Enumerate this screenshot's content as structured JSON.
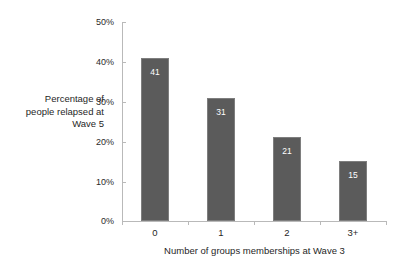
{
  "chart_data": {
    "type": "bar",
    "title": "",
    "subtitle": "",
    "categories": [
      "0",
      "1",
      "2",
      "3+"
    ],
    "values": [
      41,
      31,
      21,
      15
    ],
    "value_labels": [
      "41",
      "31",
      "21",
      "15"
    ],
    "xlabel": "Number of groups memberships at Wave 3",
    "ylabel": "Percentage of people relapsed at Wave 5",
    "ylim": [
      0,
      50
    ],
    "yticks": [
      0,
      10,
      20,
      30,
      40,
      50
    ],
    "ytick_labels": [
      "0%",
      "10%",
      "20%",
      "30%",
      "40%",
      "50%"
    ],
    "grid": false,
    "legend": null,
    "series": [
      {
        "name": "Percentage relapsed",
        "values": [
          41,
          31,
          21,
          15
        ]
      }
    ],
    "colors": {
      "bar_fill": "#5b5b5b",
      "bar_border": "#7e7e7e",
      "axis_line": "#b9b9b9",
      "axis_text": "#1f1f1f",
      "value_label_text": "#ffffff",
      "background": "#ffffff"
    }
  }
}
